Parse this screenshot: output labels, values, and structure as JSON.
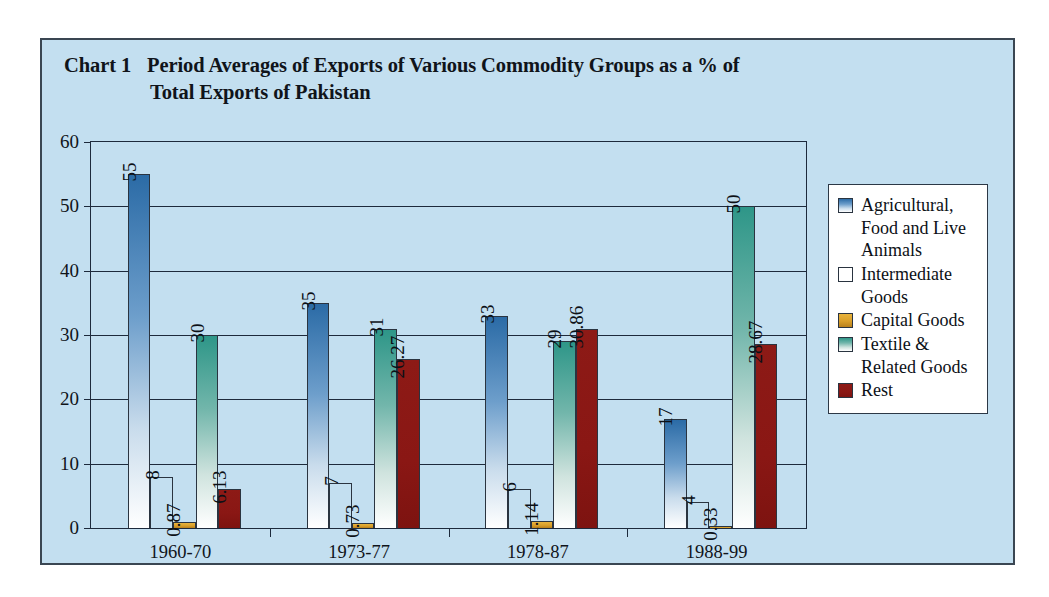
{
  "title": {
    "label": "Chart 1",
    "line1": "Period Averages of Exports of Various Commodity Groups as a  % of",
    "line2": "Total Exports of Pakistan"
  },
  "chart_data": {
    "type": "bar",
    "xlabel": "",
    "ylabel": "",
    "ylim": [
      0,
      60
    ],
    "yticks": [
      0,
      10,
      20,
      30,
      40,
      50,
      60
    ],
    "grid": true,
    "legend_position": "right",
    "categories": [
      "1960-70",
      "1973-77",
      "1978-87",
      "1988-99"
    ],
    "series": [
      {
        "name": "Agricultural, Food and Live Animals",
        "color": "#2b6ba6",
        "values": [
          55,
          35,
          33,
          17
        ],
        "labels": [
          "55",
          "35",
          "33",
          "17"
        ]
      },
      {
        "name": "Intermediate Goods",
        "color": "#bc6b33",
        "values": [
          8,
          7,
          6,
          4
        ],
        "labels": [
          "8",
          "7",
          "6",
          "4"
        ]
      },
      {
        "name": "Capital Goods",
        "color": "#e8b33c",
        "values": [
          0.87,
          0.73,
          1.14,
          0.33
        ],
        "labels": [
          "0.87",
          "0.73",
          "1.14",
          "0.33"
        ]
      },
      {
        "name": "Textile & Related Goods",
        "color": "#2e9688",
        "values": [
          30,
          31,
          29,
          50
        ],
        "labels": [
          "30",
          "31",
          "29",
          "50"
        ]
      },
      {
        "name": "Rest",
        "color": "#8d1a16",
        "values": [
          6.13,
          26.27,
          30.86,
          28.67
        ],
        "labels": [
          "6.13",
          "26.27",
          "30.86",
          "28.67"
        ]
      }
    ]
  },
  "legend": {
    "items": [
      {
        "label": "Agricultural, Food and Live Animals",
        "swatch": "legend-swatch-agricultural"
      },
      {
        "label": "Intermediate Goods",
        "swatch": "legend-swatch-intermediate"
      },
      {
        "label": "Capital Goods",
        "swatch": "legend-swatch-capital"
      },
      {
        "label": "Textile & Related Goods",
        "swatch": "legend-swatch-textile"
      },
      {
        "label": "Rest",
        "swatch": "legend-swatch-rest"
      }
    ]
  },
  "colors": {
    "frame_background": "#c3dff0",
    "frame_border": "#3a4652",
    "grid": "#1d2a3c",
    "legend_background": "#ffffff"
  }
}
